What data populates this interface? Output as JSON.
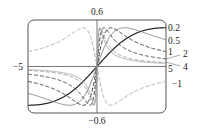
{
  "chart_data": {
    "type": "line",
    "title": "",
    "function": "f(x) = c*x / (1 + c^2 * x^2)",
    "xlabel": "",
    "ylabel": "",
    "xlim": [
      -5,
      5
    ],
    "ylim": [
      -0.6,
      0.6
    ],
    "grid": false,
    "axis_labels": {
      "x_left": "−5",
      "y_top": "0.6",
      "y_bottom": "−0.6"
    },
    "legend_position": "right (curve labels at right edge)",
    "series": [
      {
        "name": "0.2",
        "c": 0.2,
        "style": "solid",
        "color": "#222222",
        "width": 1.2
      },
      {
        "name": "0.5",
        "c": 0.5,
        "style": "solid",
        "color": "#777777",
        "width": 0.9
      },
      {
        "name": "1",
        "c": 1,
        "style": "dashed",
        "color": "#333333",
        "width": 1.0
      },
      {
        "name": "2",
        "c": 2,
        "style": "dashed",
        "color": "#444444",
        "width": 1.0
      },
      {
        "name": "4",
        "c": 4,
        "style": "dashed",
        "color": "#888888",
        "width": 0.8
      },
      {
        "name": "5",
        "c": 5,
        "style": "solid",
        "color": "#999999",
        "width": 0.8
      },
      {
        "name": "−1",
        "c": -1,
        "style": "dashed",
        "color": "#aaaaaa",
        "width": 1.0
      }
    ]
  },
  "labels": {
    "y_top": "0.6",
    "y_bottom": "−0.6",
    "x_left": "−5",
    "c_02": "0.2",
    "c_05": "0.5",
    "c_1": "1",
    "c_2": "2",
    "c_4": "4",
    "c_5": "5",
    "c_m1": "−1"
  }
}
